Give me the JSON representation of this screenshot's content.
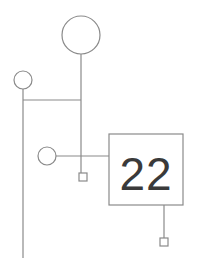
{
  "diagram": {
    "background_color": "#ffffff",
    "stroke_color": "#8a8a8a",
    "label_color": "#3a3a3a",
    "width": 199,
    "height": 266,
    "nodes": [
      {
        "id": "node-large-circle",
        "shape": "circle",
        "name": "large-circle-node",
        "cx": 81,
        "cy": 35,
        "r": 19,
        "label": ""
      },
      {
        "id": "node-small-circle-left",
        "shape": "circle",
        "name": "small-circle-node-left",
        "cx": 23,
        "cy": 80,
        "r": 9,
        "label": ""
      },
      {
        "id": "node-small-circle-mid",
        "shape": "circle",
        "name": "small-circle-node-middle",
        "cx": 47,
        "cy": 156,
        "r": 9,
        "label": ""
      },
      {
        "id": "node-square-22",
        "shape": "square",
        "name": "labeled-square-node",
        "x": 109,
        "y": 134,
        "w": 74,
        "h": 71,
        "label": "22"
      },
      {
        "id": "node-tiny-square-left",
        "shape": "square",
        "name": "tiny-square-node-left",
        "x": 79,
        "y": 173,
        "w": 8,
        "h": 8,
        "label": ""
      },
      {
        "id": "node-tiny-square-right",
        "shape": "square",
        "name": "tiny-square-node-right",
        "x": 160,
        "y": 238,
        "w": 8,
        "h": 8,
        "label": ""
      }
    ],
    "connectors": [
      {
        "id": "conn-large-circle-down",
        "name": "connector-large-circle-vertical",
        "x1": 81,
        "y1": 54,
        "x2": 81,
        "y2": 173
      },
      {
        "id": "conn-small-left-down",
        "name": "connector-left-circle-vertical",
        "x1": 23,
        "y1": 89,
        "x2": 23,
        "y2": 258
      },
      {
        "id": "conn-horizontal-top",
        "name": "connector-horizontal-upper",
        "x1": 23,
        "y1": 100,
        "x2": 81,
        "y2": 100
      },
      {
        "id": "conn-horizontal-mid",
        "name": "connector-horizontal-middle",
        "x1": 56,
        "y1": 156,
        "x2": 109,
        "y2": 156
      },
      {
        "id": "conn-square-down",
        "name": "connector-square-vertical",
        "x1": 164,
        "y1": 205,
        "x2": 164,
        "y2": 238
      }
    ]
  }
}
